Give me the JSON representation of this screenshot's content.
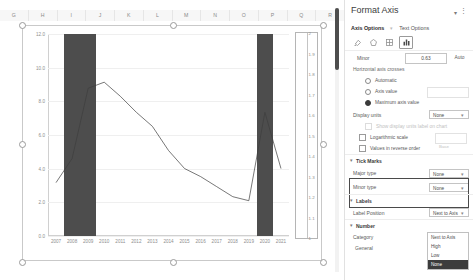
{
  "spreadsheet": {
    "columns": [
      "G",
      "H",
      "I",
      "J",
      "K",
      "L",
      "M",
      "N",
      "O",
      "P",
      "Q",
      "R"
    ]
  },
  "chart_data": {
    "type": "line",
    "title": "",
    "xlabel": "",
    "ylabel": "",
    "categories": [
      "2007",
      "2008",
      "2009",
      "2010",
      "2011",
      "2012",
      "2013",
      "2014",
      "2015",
      "2016",
      "2017",
      "2018",
      "2019",
      "2020",
      "2021"
    ],
    "series": [
      {
        "name": "Unemployment Rate",
        "values": [
          4.6,
          5.8,
          9.3,
          9.6,
          8.9,
          8.1,
          7.4,
          6.2,
          5.3,
          4.9,
          4.4,
          3.9,
          3.7,
          8.1,
          5.3
        ]
      }
    ],
    "ylim": [
      0,
      12
    ],
    "yticks": [
      "0.0",
      "2.0",
      "4.0",
      "6.0",
      "8.0",
      "10.0",
      "12.0"
    ],
    "secondary_axis": {
      "ylim": [
        1,
        2
      ],
      "yticks": [
        "1",
        "1.1",
        "1.2",
        "1.3",
        "1.4",
        "1.5",
        "1.6",
        "1.7",
        "1.8",
        "1.9",
        "2"
      ]
    },
    "shaded_bands": [
      {
        "name": "recession-2008",
        "from": "2008",
        "to": "2009",
        "color": "#4d4d4d"
      },
      {
        "name": "recession-2020",
        "from": "2020",
        "to": "2020",
        "color": "#4d4d4d"
      }
    ],
    "grid": true,
    "legend": "none"
  },
  "pane": {
    "title": "Format Axis",
    "collapse_icon": "chevron-down-icon",
    "more_icon": "more-options-icon",
    "tabs": [
      {
        "label": "Axis Options",
        "active": true
      },
      {
        "label": "Text Options",
        "active": false
      }
    ],
    "icons": [
      {
        "name": "fill-line-icon",
        "glyph": "◔",
        "selected": false
      },
      {
        "name": "effects-icon",
        "glyph": "⬠",
        "selected": false
      },
      {
        "name": "size-properties-icon",
        "glyph": "▦",
        "selected": false
      },
      {
        "name": "axis-options-icon",
        "glyph": "ᴴ",
        "selected": true
      }
    ],
    "minor_row": {
      "label": "Minor",
      "value": "0.63",
      "auto_label": "Auto"
    },
    "horizontal_axis_crosses": {
      "label": "Horizontal axis crosses",
      "options": [
        {
          "label": "Automatic",
          "selected": false
        },
        {
          "label": "Axis value",
          "selected": false
        },
        {
          "label": "Maximum axis value",
          "selected": true
        }
      ],
      "axis_value": ""
    },
    "display_units": {
      "label": "Display units",
      "value": "None"
    },
    "show_units_label": "Show display units label on chart",
    "logarithmic": {
      "label": "Logarithmic scale",
      "base_label": "Base",
      "base_value": "10",
      "checked": false
    },
    "reverse_order": {
      "label": "Values in reverse order",
      "checked": false
    },
    "tick_marks": {
      "title": "Tick Marks",
      "major": {
        "label": "Major type",
        "value": "None"
      },
      "minor": {
        "label": "Minor type",
        "value": "None"
      }
    },
    "labels": {
      "title": "Labels",
      "position_label": "Label Position",
      "position_value": "Next to Axis",
      "options": [
        {
          "label": "Next to Axis",
          "highlighted": false
        },
        {
          "label": "High",
          "highlighted": false
        },
        {
          "label": "Low",
          "highlighted": false
        },
        {
          "label": "None",
          "highlighted": true
        }
      ]
    },
    "number": {
      "title": "Number",
      "category_label": "Category",
      "category_value": "General"
    }
  }
}
